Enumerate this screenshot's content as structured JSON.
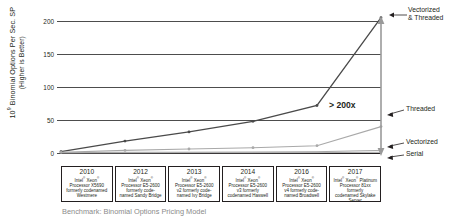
{
  "axis": {
    "y_title_line1": "10",
    "y_title_exp": "9",
    "y_title_line1b": " Binomial Options Per Sec. SP",
    "y_title_line2": "(Higher is Better)",
    "ticks": [
      "200",
      "150",
      "100",
      "50",
      "0"
    ]
  },
  "annotations": {
    "vectorized_threaded": "Vectorized",
    "vectorized_threaded2": "& Threaded",
    "threaded": "Threaded",
    "vectorized": "Vectorized",
    "serial": "Serial",
    "speedup": "> 200x"
  },
  "caption": "Benchmark: Binomial Options Pricing Model",
  "processors": [
    {
      "year": "2010",
      "l1": "Intel",
      "r1": "®",
      "l2": " Xeon",
      "r2": "®",
      "l3": "Processor X5690",
      "l4": "formerly codenamed",
      "l5": "Westmere"
    },
    {
      "year": "2012",
      "l1": "Intel",
      "r1": "®",
      "l2": " Xeon",
      "r2": "®",
      "l3": "Processor E5-2600",
      "l4": "formerly code-",
      "l5": "named Sandy Bridge"
    },
    {
      "year": "2013",
      "l1": "Intel",
      "r1": "®",
      "l2": " Xeon",
      "r2": "®",
      "l3": "Processor E5-2600",
      "l4": "v2 formerly code-",
      "l5": "named Ivy Bridge"
    },
    {
      "year": "2014",
      "l1": "Intel",
      "r1": "®",
      "l2": " Xeon",
      "r2": "®",
      "l3": "Processor E5-2600",
      "l4": "v3 formerly",
      "l5": "codenamed Haswell"
    },
    {
      "year": "2016",
      "l1": "Intel",
      "r1": "®",
      "l2": " Xeon",
      "r2": "®",
      "l3": "Processor E5-2600",
      "l4": "v4 formerly code-",
      "l5": "named Broadwell"
    },
    {
      "year": "2017",
      "l1": "Intel",
      "r1": "®",
      "l2": " Xeon",
      "r2": "®",
      "l3": " Platinum",
      "l4": "Processor 81xx formerly",
      "l5": "codenamed Skylake",
      "l6": "Server"
    }
  ],
  "colors": {
    "dark_line": "#4a4a4a",
    "light_line": "#a9a9a9",
    "grid": "#4d4d4d",
    "caption": "#8a8a8a",
    "arrow": "#9a9a9a"
  },
  "chart_data": {
    "type": "line",
    "title": "",
    "xlabel": "",
    "ylabel": "10^9 Binomial Options Per Sec. SP (Higher is Better)",
    "categories": [
      "2010",
      "2012",
      "2013",
      "2014",
      "2016",
      "2017"
    ],
    "ylim": [
      0,
      215
    ],
    "yticks": [
      0,
      50,
      100,
      150,
      200
    ],
    "grid": true,
    "legend": "annotated at right",
    "series": [
      {
        "name": "Vectorized & Threaded",
        "values": [
          2,
          18,
          32,
          48,
          72,
          205
        ],
        "color": "#4a4a4a"
      },
      {
        "name": "Threaded",
        "values": [
          1,
          4,
          6,
          8,
          11,
          40
        ],
        "color": "#a9a9a9"
      },
      {
        "name": "Vectorized",
        "values": [
          0.5,
          1,
          1.2,
          1.5,
          2,
          4
        ],
        "color": "#a9a9a9"
      },
      {
        "name": "Serial",
        "values": [
          0.2,
          0.3,
          0.4,
          0.5,
          0.6,
          1
        ],
        "color": "#a9a9a9"
      }
    ],
    "annotations": [
      {
        "text": "> 200x",
        "at": "2017",
        "note": "speedup bracket from Serial to Vectorized & Threaded"
      }
    ]
  }
}
